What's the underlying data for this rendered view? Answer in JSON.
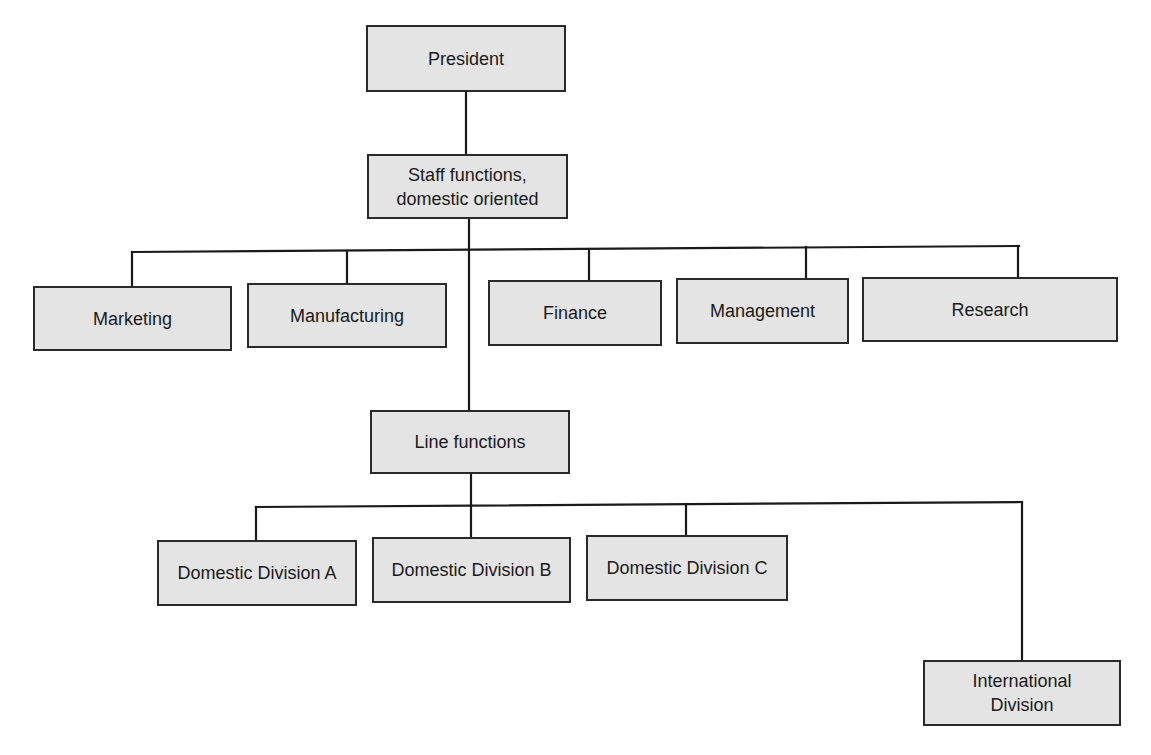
{
  "diagram": {
    "type": "organizational-chart",
    "colors": {
      "box_fill": "#e4e4e4",
      "box_border": "#2a2a2a",
      "line": "#1a1a1a",
      "background": "#ffffff"
    },
    "nodes": [
      {
        "id": "president",
        "label": "President",
        "x": 366,
        "y": 25,
        "w": 200,
        "h": 67
      },
      {
        "id": "staff",
        "label": "Staff functions,\ndomestic oriented",
        "x": 367,
        "y": 154,
        "w": 201,
        "h": 65
      },
      {
        "id": "marketing",
        "label": "Marketing",
        "x": 33,
        "y": 286,
        "w": 199,
        "h": 65
      },
      {
        "id": "manufacturing",
        "label": "Manufacturing",
        "x": 247,
        "y": 283,
        "w": 200,
        "h": 65
      },
      {
        "id": "finance",
        "label": "Finance",
        "x": 488,
        "y": 280,
        "w": 174,
        "h": 66
      },
      {
        "id": "management",
        "label": "Management",
        "x": 676,
        "y": 278,
        "w": 173,
        "h": 66
      },
      {
        "id": "research",
        "label": "Research",
        "x": 862,
        "y": 277,
        "w": 256,
        "h": 65
      },
      {
        "id": "line",
        "label": "Line functions",
        "x": 370,
        "y": 410,
        "w": 200,
        "h": 64
      },
      {
        "id": "div-a",
        "label": "Domestic Division A",
        "x": 157,
        "y": 540,
        "w": 200,
        "h": 66
      },
      {
        "id": "div-b",
        "label": "Domestic Division B",
        "x": 372,
        "y": 537,
        "w": 199,
        "h": 66
      },
      {
        "id": "div-c",
        "label": "Domestic Division C",
        "x": 586,
        "y": 535,
        "w": 202,
        "h": 66
      },
      {
        "id": "international",
        "label": "International\nDivision",
        "x": 923,
        "y": 660,
        "w": 198,
        "h": 66
      }
    ],
    "edges": [
      [
        "president",
        "staff"
      ],
      [
        "staff",
        "marketing"
      ],
      [
        "staff",
        "manufacturing"
      ],
      [
        "staff",
        "finance"
      ],
      [
        "staff",
        "management"
      ],
      [
        "staff",
        "research"
      ],
      [
        "staff",
        "line"
      ],
      [
        "line",
        "div-a"
      ],
      [
        "line",
        "div-b"
      ],
      [
        "line",
        "div-c"
      ],
      [
        "line",
        "international"
      ]
    ],
    "lines": [
      {
        "x1": 466,
        "y1": 92,
        "x2": 466,
        "y2": 154
      },
      {
        "x1": 469,
        "y1": 219,
        "x2": 469,
        "y2": 410
      },
      {
        "x1": 132,
        "y1": 252,
        "x2": 1019,
        "y2": 246
      },
      {
        "x1": 132,
        "y1": 252,
        "x2": 132,
        "y2": 286
      },
      {
        "x1": 347,
        "y1": 251,
        "x2": 347,
        "y2": 283
      },
      {
        "x1": 589,
        "y1": 249,
        "x2": 589,
        "y2": 280
      },
      {
        "x1": 806,
        "y1": 247,
        "x2": 806,
        "y2": 278
      },
      {
        "x1": 1018,
        "y1": 246,
        "x2": 1018,
        "y2": 277
      },
      {
        "x1": 471,
        "y1": 474,
        "x2": 471,
        "y2": 537
      },
      {
        "x1": 256,
        "y1": 507,
        "x2": 1022,
        "y2": 502
      },
      {
        "x1": 256,
        "y1": 507,
        "x2": 256,
        "y2": 540
      },
      {
        "x1": 686,
        "y1": 504,
        "x2": 686,
        "y2": 535
      },
      {
        "x1": 1022,
        "y1": 502,
        "x2": 1022,
        "y2": 660
      }
    ]
  }
}
